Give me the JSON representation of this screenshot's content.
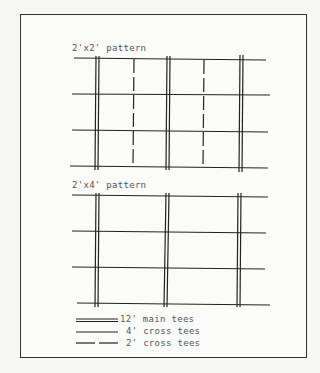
{
  "diagram": {
    "panels": [
      {
        "title": "2'x2' pattern",
        "main_tee_x": [
          97,
          168,
          241
        ],
        "cross_tee_4ft_y": [
          58,
          94,
          131,
          167
        ],
        "cross_tee_2ft_x": [
          133,
          204
        ]
      },
      {
        "title": "2'x4' pattern",
        "main_tee_x": [
          97,
          167,
          240
        ],
        "cross_tee_4ft_y": [
          196,
          232,
          268,
          304
        ]
      }
    ],
    "legend": [
      {
        "symbol": "double-line",
        "label": "12' main tees"
      },
      {
        "symbol": "solid-line",
        "label": "4' cross tees"
      },
      {
        "symbol": "dashed-line",
        "label": "2' cross tees"
      }
    ]
  }
}
